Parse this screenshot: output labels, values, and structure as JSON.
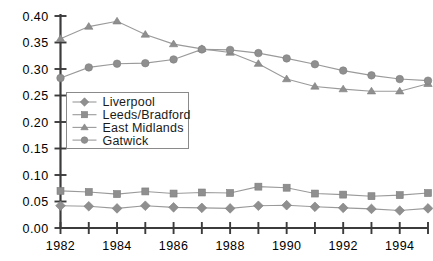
{
  "chart_data": {
    "type": "line",
    "title": "",
    "subtitle": "",
    "xlabel": "",
    "ylabel": "",
    "x": [
      1982,
      1983,
      1984,
      1985,
      1986,
      1987,
      1988,
      1989,
      1990,
      1991,
      1992,
      1993,
      1994,
      1995
    ],
    "xlim": [
      1982,
      1995
    ],
    "ylim": [
      0.0,
      0.4
    ],
    "xtick_labels": [
      "1982",
      "1984",
      "1986",
      "1988",
      "1990",
      "1992",
      "1994"
    ],
    "xtick_values": [
      1982,
      1984,
      1986,
      1988,
      1990,
      1992,
      1994
    ],
    "xticks_all": [
      1982,
      1983,
      1984,
      1985,
      1986,
      1987,
      1988,
      1989,
      1990,
      1991,
      1992,
      1993,
      1994,
      1995
    ],
    "ytick_labels": [
      "0.00",
      "0.05",
      "0.10",
      "0.15",
      "0.20",
      "0.25",
      "0.30",
      "0.35",
      "0.40"
    ],
    "ytick_values": [
      0.0,
      0.05,
      0.1,
      0.15,
      0.2,
      0.25,
      0.3,
      0.35,
      0.4
    ],
    "grid": false,
    "legend_position": "center-left",
    "series": [
      {
        "name": "Liverpool",
        "marker": "diamond",
        "color": "#8f8f8f",
        "values": [
          0.042,
          0.041,
          0.037,
          0.042,
          0.039,
          0.038,
          0.037,
          0.042,
          0.043,
          0.04,
          0.038,
          0.036,
          0.033,
          0.037
        ]
      },
      {
        "name": "Leeds/Bradford",
        "marker": "square",
        "color": "#8f8f8f",
        "values": [
          0.07,
          0.068,
          0.064,
          0.069,
          0.065,
          0.067,
          0.066,
          0.078,
          0.076,
          0.065,
          0.063,
          0.06,
          0.062,
          0.066
        ]
      },
      {
        "name": "East Midlands",
        "marker": "triangle",
        "color": "#8f8f8f",
        "values": [
          0.357,
          0.38,
          0.39,
          0.365,
          0.347,
          0.338,
          0.331,
          0.31,
          0.281,
          0.267,
          0.262,
          0.258,
          0.258,
          0.272
        ]
      },
      {
        "name": "Gatwick",
        "marker": "circle",
        "color": "#8f8f8f",
        "values": [
          0.283,
          0.303,
          0.31,
          0.311,
          0.318,
          0.337,
          0.336,
          0.33,
          0.32,
          0.309,
          0.297,
          0.288,
          0.281,
          0.278
        ]
      }
    ]
  },
  "legend": {
    "entries": [
      "Liverpool",
      "Leeds/Bradford",
      "East Midlands",
      "Gatwick"
    ]
  },
  "colors": {
    "series": "#8f8f8f",
    "axis": "#3b3b3b",
    "text": "#000000",
    "legend_border": "#8a8a8a",
    "background": "#ffffff"
  }
}
